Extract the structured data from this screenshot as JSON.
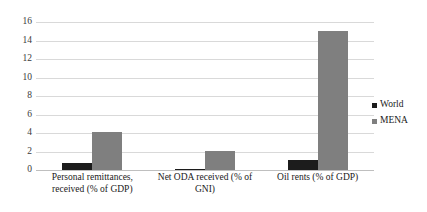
{
  "chart_data": {
    "type": "bar",
    "title": "",
    "subtitle": "",
    "xlabel": "",
    "ylabel": "",
    "categories": [
      "Personal remittances, received (% of GDP)",
      "Net ODA received (% of GNI)",
      "Oil rents (% of GDP)"
    ],
    "series": [
      {
        "name": "World",
        "color": "#1c1c1c",
        "values": [
          0.75,
          0.15,
          1.1
        ]
      },
      {
        "name": "MENA",
        "color": "#7f7f7f",
        "values": [
          4.1,
          2.1,
          15.0
        ]
      }
    ],
    "ylim": [
      0,
      16
    ],
    "yticks": [
      0,
      2,
      4,
      6,
      8,
      10,
      12,
      14,
      16
    ],
    "ytick_labels": [
      "0",
      "2",
      "4",
      "6",
      "8",
      "10",
      "12",
      "14",
      "16"
    ],
    "grid": true,
    "grid_axis": "y",
    "legend_position": "right",
    "background_color": "#ffffff",
    "gridline_color": "#d9d9d9"
  },
  "legend": {
    "entries": [
      {
        "label": "World",
        "swatch": "legend-swatch-world"
      },
      {
        "label": "MENA",
        "swatch": "legend-swatch-mena"
      }
    ]
  }
}
